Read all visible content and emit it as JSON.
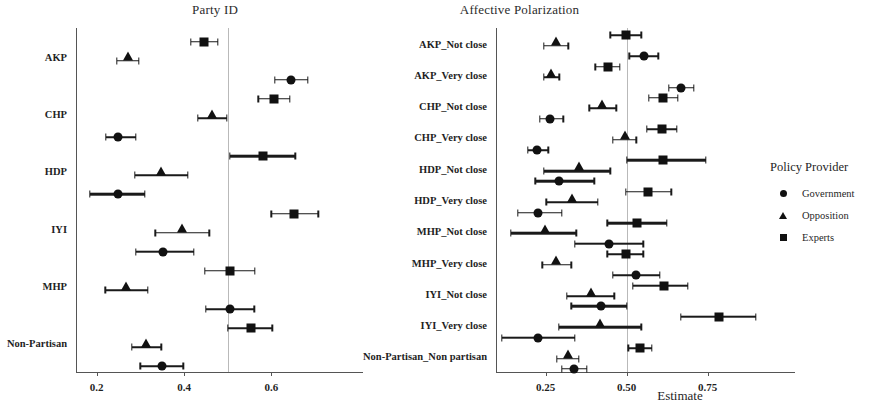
{
  "figure": {
    "axis_title": "Estimate",
    "legend": {
      "title": "Policy Provider",
      "items": [
        {
          "label": "Government",
          "marker": "circle-icon"
        },
        {
          "label": "Opposition",
          "marker": "triangle-icon"
        },
        {
          "label": "Experts",
          "marker": "square-icon"
        }
      ]
    }
  },
  "chart_data": [
    {
      "type": "scatter",
      "title": "Party ID",
      "xlabel": "Estimate",
      "ylabel": "",
      "xlim": [
        0.155,
        0.78
      ],
      "xticks": [
        0.2,
        0.4,
        0.6
      ],
      "xtick_labels": [
        "0.2",
        "0.4",
        "0.6"
      ],
      "reference_line": 0.5,
      "grid": false,
      "legend_position": "right",
      "categories": [
        "AKP",
        "CHP",
        "HDP",
        "IYI",
        "MHP",
        "Non-Partisan"
      ],
      "series": [
        {
          "name": "Experts",
          "marker": "square",
          "points": [
            {
              "category": "AKP",
              "estimate": 0.445,
              "ci_low": 0.415,
              "ci_high": 0.477
            },
            {
              "category": "CHP",
              "estimate": 0.605,
              "ci_low": 0.57,
              "ci_high": 0.642
            },
            {
              "category": "HDP",
              "estimate": 0.58,
              "ci_low": 0.505,
              "ci_high": 0.655
            },
            {
              "category": "IYI",
              "estimate": 0.652,
              "ci_low": 0.6,
              "ci_high": 0.707
            },
            {
              "category": "MHP",
              "estimate": 0.505,
              "ci_low": 0.448,
              "ci_high": 0.562
            },
            {
              "category": "Non-Partisan",
              "estimate": 0.553,
              "ci_low": 0.5,
              "ci_high": 0.602
            }
          ]
        },
        {
          "name": "Opposition",
          "marker": "triangle",
          "points": [
            {
              "category": "AKP",
              "estimate": 0.271,
              "ci_low": 0.246,
              "ci_high": 0.297
            },
            {
              "category": "CHP",
              "estimate": 0.464,
              "ci_low": 0.432,
              "ci_high": 0.498
            },
            {
              "category": "HDP",
              "estimate": 0.348,
              "ci_low": 0.288,
              "ci_high": 0.408
            },
            {
              "category": "IYI",
              "estimate": 0.396,
              "ci_low": 0.334,
              "ci_high": 0.458
            },
            {
              "category": "MHP",
              "estimate": 0.268,
              "ci_low": 0.22,
              "ci_high": 0.317
            },
            {
              "category": "Non-Partisan",
              "estimate": 0.313,
              "ci_low": 0.28,
              "ci_high": 0.348
            }
          ]
        },
        {
          "name": "Government",
          "marker": "circle",
          "points": [
            {
              "category": "AKP",
              "estimate": 0.645,
              "ci_low": 0.608,
              "ci_high": 0.683
            },
            {
              "category": "CHP",
              "estimate": 0.249,
              "ci_low": 0.221,
              "ci_high": 0.29
            },
            {
              "category": "HDP",
              "estimate": 0.248,
              "ci_low": 0.184,
              "ci_high": 0.31
            },
            {
              "category": "IYI",
              "estimate": 0.352,
              "ci_low": 0.29,
              "ci_high": 0.423
            },
            {
              "category": "MHP",
              "estimate": 0.506,
              "ci_low": 0.45,
              "ci_high": 0.561
            },
            {
              "category": "Non-Partisan",
              "estimate": 0.35,
              "ci_low": 0.3,
              "ci_high": 0.398
            }
          ]
        }
      ]
    },
    {
      "type": "scatter",
      "title": "Affective Polarization",
      "xlabel": "Estimate",
      "ylabel": "",
      "xlim": [
        0.1,
        0.98
      ],
      "xticks": [
        0.25,
        0.5,
        0.75
      ],
      "xtick_labels": [
        "0.25",
        "0.50",
        "0.75"
      ],
      "reference_line": 0.5,
      "grid": false,
      "legend_position": "right",
      "categories": [
        "AKP_Not close",
        "AKP_Very close",
        "CHP_Not close",
        "CHP_Very close",
        "HDP_Not close",
        "HDP_Very close",
        "MHP_Not close",
        "MHP_Very close",
        "IYI_Not close",
        "IYI_Very close",
        "Non-Partisan_Non partisan"
      ],
      "series": [
        {
          "name": "Experts",
          "marker": "square",
          "points": [
            {
              "category": "AKP_Not close",
              "estimate": 0.497,
              "ci_low": 0.45,
              "ci_high": 0.545
            },
            {
              "category": "AKP_Very close",
              "estimate": 0.442,
              "ci_low": 0.404,
              "ci_high": 0.48
            },
            {
              "category": "CHP_Not close",
              "estimate": 0.613,
              "ci_low": 0.568,
              "ci_high": 0.658
            },
            {
              "category": "CHP_Very close",
              "estimate": 0.61,
              "ci_low": 0.562,
              "ci_high": 0.655
            },
            {
              "category": "HDP_Not close",
              "estimate": 0.613,
              "ci_low": 0.5,
              "ci_high": 0.745
            },
            {
              "category": "HDP_Very close",
              "estimate": 0.566,
              "ci_low": 0.498,
              "ci_high": 0.638
            },
            {
              "category": "MHP_Not close",
              "estimate": 0.532,
              "ci_low": 0.44,
              "ci_high": 0.625
            },
            {
              "category": "MHP_Very close",
              "estimate": 0.497,
              "ci_low": 0.44,
              "ci_high": 0.552
            },
            {
              "category": "IYI_Not close",
              "estimate": 0.616,
              "ci_low": 0.52,
              "ci_high": 0.69
            },
            {
              "category": "IYI_Very close",
              "estimate": 0.785,
              "ci_low": 0.668,
              "ci_high": 0.9
            },
            {
              "category": "Non-Partisan_Non partisan",
              "estimate": 0.542,
              "ci_low": 0.506,
              "ci_high": 0.578
            }
          ]
        },
        {
          "name": "Opposition",
          "marker": "triangle",
          "points": [
            {
              "category": "AKP_Not close",
              "estimate": 0.281,
              "ci_low": 0.245,
              "ci_high": 0.32
            },
            {
              "category": "AKP_Very close",
              "estimate": 0.267,
              "ci_low": 0.244,
              "ci_high": 0.292
            },
            {
              "category": "CHP_Not close",
              "estimate": 0.425,
              "ci_low": 0.385,
              "ci_high": 0.468
            },
            {
              "category": "CHP_Very close",
              "estimate": 0.496,
              "ci_low": 0.458,
              "ci_high": 0.53
            },
            {
              "category": "HDP_Not close",
              "estimate": 0.352,
              "ci_low": 0.245,
              "ci_high": 0.45
            },
            {
              "category": "HDP_Very close",
              "estimate": 0.332,
              "ci_low": 0.252,
              "ci_high": 0.412
            },
            {
              "category": "MHP_Not close",
              "estimate": 0.248,
              "ci_low": 0.142,
              "ci_high": 0.345
            },
            {
              "category": "MHP_Very close",
              "estimate": 0.282,
              "ci_low": 0.24,
              "ci_high": 0.33
            },
            {
              "category": "IYI_Not close",
              "estimate": 0.39,
              "ci_low": 0.315,
              "ci_high": 0.462
            },
            {
              "category": "IYI_Very close",
              "estimate": 0.418,
              "ci_low": 0.29,
              "ci_high": 0.545
            },
            {
              "category": "Non-Partisan_Non partisan",
              "estimate": 0.318,
              "ci_low": 0.285,
              "ci_high": 0.353
            }
          ]
        },
        {
          "name": "Government",
          "marker": "circle",
          "points": [
            {
              "category": "AKP_Not close",
              "estimate": 0.554,
              "ci_low": 0.508,
              "ci_high": 0.598
            },
            {
              "category": "AKP_Very close",
              "estimate": 0.668,
              "ci_low": 0.63,
              "ci_high": 0.708
            },
            {
              "category": "CHP_Not close",
              "estimate": 0.265,
              "ci_low": 0.232,
              "ci_high": 0.305
            },
            {
              "category": "CHP_Very close",
              "estimate": 0.223,
              "ci_low": 0.195,
              "ci_high": 0.258
            },
            {
              "category": "HDP_Not close",
              "estimate": 0.291,
              "ci_low": 0.218,
              "ci_high": 0.4
            },
            {
              "category": "HDP_Very close",
              "estimate": 0.228,
              "ci_low": 0.165,
              "ci_high": 0.3
            },
            {
              "category": "MHP_Not close",
              "estimate": 0.445,
              "ci_low": 0.34,
              "ci_high": 0.552
            },
            {
              "category": "MHP_Very close",
              "estimate": 0.53,
              "ci_low": 0.458,
              "ci_high": 0.602
            },
            {
              "category": "IYI_Not close",
              "estimate": 0.422,
              "ci_low": 0.33,
              "ci_high": 0.5
            },
            {
              "category": "IYI_Very close",
              "estimate": 0.226,
              "ci_low": 0.115,
              "ci_high": 0.34
            },
            {
              "category": "Non-Partisan_Non partisan",
              "estimate": 0.338,
              "ci_low": 0.3,
              "ci_high": 0.378
            }
          ]
        }
      ]
    }
  ]
}
